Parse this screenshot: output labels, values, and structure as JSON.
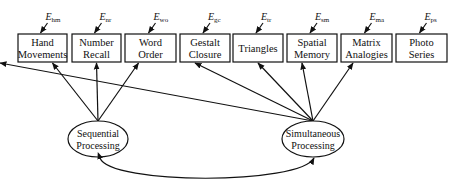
{
  "diagram": {
    "type": "path-diagram",
    "indicators": [
      {
        "id": "hm",
        "line1": "Hand",
        "line2": "Movements",
        "error": "E",
        "error_sub": "hm",
        "x": 18,
        "w": 49
      },
      {
        "id": "nr",
        "line1": "Number",
        "line2": "Recall",
        "error": "E",
        "error_sub": "nr",
        "x": 72,
        "w": 49
      },
      {
        "id": "wo",
        "line1": "Word",
        "line2": "Order",
        "error": "E",
        "error_sub": "wo",
        "x": 125,
        "w": 51
      },
      {
        "id": "gc",
        "line1": "Gestalt",
        "line2": "Closure",
        "error": "E",
        "error_sub": "gc",
        "x": 180,
        "w": 50
      },
      {
        "id": "tr",
        "line1": "Triangles",
        "line2": "",
        "error": "E",
        "error_sub": "tr",
        "x": 233,
        "w": 50
      },
      {
        "id": "sm",
        "line1": "Spatial",
        "line2": "Memory",
        "error": "E",
        "error_sub": "sm",
        "x": 287,
        "w": 50
      },
      {
        "id": "ma",
        "line1": "Matrix",
        "line2": "Analogies",
        "error": "E",
        "error_sub": "ma",
        "x": 341,
        "w": 51
      },
      {
        "id": "ps",
        "line1": "Photo",
        "line2": "Series",
        "error": "E",
        "error_sub": "ps",
        "x": 396,
        "w": 51
      }
    ],
    "factors": [
      {
        "id": "seq",
        "line1": "Sequential",
        "line2": "Processing",
        "cx": 98,
        "cy": 139
      },
      {
        "id": "sim",
        "line1": "Simultaneous",
        "line2": "Processing",
        "cx": 313,
        "cy": 139
      }
    ],
    "colors": {
      "stroke": "#111111",
      "background": "#ffffff"
    }
  }
}
